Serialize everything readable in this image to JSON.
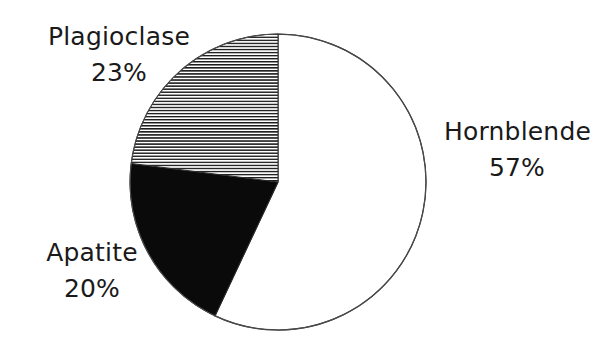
{
  "chart_data": {
    "type": "pie",
    "title": "",
    "categories": [
      "Hornblende",
      "Apatite",
      "Plagioclase"
    ],
    "values": [
      57,
      20,
      23
    ],
    "value_unit": "%",
    "slices": [
      {
        "label": "Hornblende",
        "value": 57,
        "value_text": "57%",
        "fill_style": "white",
        "fill_color": "#ffffff",
        "stroke_color": "#2b2b2b",
        "start_angle_deg": 0,
        "end_angle_deg": 205.2
      },
      {
        "label": "Apatite",
        "value": 20,
        "value_text": "20%",
        "fill_style": "solid-black",
        "fill_color": "#0a0a0a",
        "stroke_color": "#2b2b2b",
        "start_angle_deg": 205.2,
        "end_angle_deg": 277.2
      },
      {
        "label": "Plagioclase",
        "value": 23,
        "value_text": "23%",
        "fill_style": "horizontal-hatch",
        "fill_color": "#1a1a1a",
        "stroke_color": "#2b2b2b",
        "start_angle_deg": 277.2,
        "end_angle_deg": 360
      }
    ],
    "geometry": {
      "center_x": 278,
      "center_y": 182,
      "radius": 148,
      "start_at_twelve_oclock": true,
      "direction": "clockwise"
    },
    "legend_position": "outside-labels",
    "grid": false,
    "background_color": "#ffffff",
    "text_color": "#1a1a1a"
  },
  "labels": {
    "plagioclase": {
      "name": "Plagioclase",
      "value": "23%"
    },
    "apatite": {
      "name": "Apatite",
      "value": "20%"
    },
    "hornblende": {
      "name": "Hornblende",
      "value": "57%"
    }
  }
}
